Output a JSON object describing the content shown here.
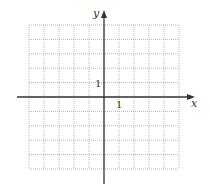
{
  "diagram": {
    "type": "coordinate-grid",
    "x_axis_label": "x",
    "y_axis_label": "y",
    "x_unit_label": "1",
    "y_unit_label": "1",
    "grid": {
      "columns": 10,
      "rows": 10,
      "x_range": [
        -5,
        5
      ],
      "y_range": [
        -5,
        5
      ],
      "line_style": "dotted",
      "line_color": "#b8b8b8"
    },
    "axis_color": "#333333"
  }
}
